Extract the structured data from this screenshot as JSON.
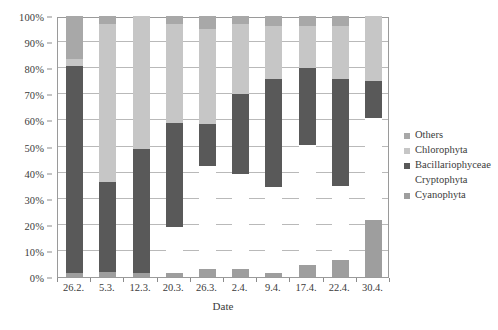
{
  "chart_data": {
    "type": "bar",
    "stacked": true,
    "normalized_percent": true,
    "title": "",
    "subtitle": "",
    "xlabel": "Date",
    "ylabel": "",
    "ylim": [
      0,
      100
    ],
    "ytick_labels": [
      "0%",
      "10%",
      "20%",
      "30%",
      "40%",
      "50%",
      "60%",
      "70%",
      "80%",
      "90%",
      "100%"
    ],
    "ytick_values": [
      0,
      10,
      20,
      30,
      40,
      50,
      60,
      70,
      80,
      90,
      100
    ],
    "grid": "horizontal",
    "legend_position": "right",
    "categories": [
      "26.2.",
      "5.3.",
      "12.3.",
      "20.3.",
      "26.3.",
      "2.4.",
      "9.4.",
      "17.4.",
      "22.4.",
      "30.4."
    ],
    "stack_order_bottom_to_top": [
      "Cyanophyta",
      "Cryptophyta",
      "Bacillariophyceae",
      "Chlorophyta",
      "Others"
    ],
    "series": [
      {
        "name": "Cyanophyta",
        "color": "#9e9e9e",
        "values": [
          1.5,
          2.0,
          1.5,
          1.5,
          3.0,
          3.0,
          1.5,
          4.5,
          6.5,
          22.0
        ]
      },
      {
        "name": "Cryptophyta",
        "color": "#ffffff",
        "values": [
          0.0,
          0.0,
          0.0,
          17.5,
          39.5,
          36.5,
          33.0,
          46.0,
          28.5,
          39.0
        ]
      },
      {
        "name": "Bacillariophyceae",
        "color": "#595959",
        "values": [
          79.5,
          34.5,
          47.5,
          40.0,
          16.0,
          30.5,
          41.5,
          29.5,
          41.0,
          14.0
        ]
      },
      {
        "name": "Chlorophyta",
        "color": "#c6c6c6",
        "values": [
          2.5,
          60.5,
          51.0,
          38.0,
          36.5,
          27.0,
          20.0,
          16.0,
          20.0,
          25.0
        ]
      },
      {
        "name": "Others",
        "color": "#a8a8a8",
        "values": [
          16.5,
          3.0,
          0.0,
          3.0,
          5.0,
          3.0,
          4.0,
          4.0,
          4.0,
          0.0
        ]
      }
    ],
    "legend_entries": [
      {
        "label": "Others",
        "color": "#a8a8a8"
      },
      {
        "label": "Chlorophyta",
        "color": "#c6c6c6"
      },
      {
        "label": "Bacillariophyceae",
        "color": "#595959"
      },
      {
        "label": "Cryptophyta",
        "color": "#ffffff"
      },
      {
        "label": "Cyanophyta",
        "color": "#9e9e9e"
      }
    ]
  },
  "style": {
    "plot_border_color": "#9a9a9a",
    "gridline_color": "#b9b9b9",
    "tick_color": "#8c8c8c",
    "text_color": "#3b3b3b",
    "background": "#ffffff"
  }
}
